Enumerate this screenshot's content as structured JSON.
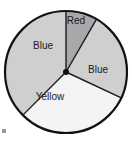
{
  "figure": {
    "background_color": "#ffffff",
    "corner_mark_color": "#9a9a9a"
  },
  "chart_data": {
    "type": "pie",
    "title": "",
    "subtitle": "",
    "xlabel": "",
    "ylabel": "",
    "legend_position": "none",
    "grid": false,
    "labels_on_slices": true,
    "center": {
      "x": 66,
      "y": 72
    },
    "radius": 61,
    "outline_color": "#111111",
    "outline_width": 2.2,
    "divider_color": "#1a1a1a",
    "divider_width": 1.4,
    "hub_color": "#111111",
    "hub_radius": 3,
    "start_angle_deg": 90,
    "direction": "clockwise",
    "categories": [
      "Red",
      "Blue",
      "Yellow",
      "Blue"
    ],
    "values": [
      8.3,
      23.6,
      30.6,
      25.0
    ],
    "slices": [
      {
        "label": "Red",
        "value": 8.3,
        "start_angle_deg": 90,
        "end_angle_deg": 60,
        "fill": "#a8a8a8",
        "label_x": 76,
        "label_y": 21
      },
      {
        "label": "Blue",
        "value": 23.6,
        "start_angle_deg": 60,
        "end_angle_deg": -25,
        "fill": "#cfcfcf",
        "label_x": 98,
        "label_y": 70
      },
      {
        "label": "Yellow",
        "value": 30.6,
        "start_angle_deg": -25,
        "end_angle_deg": -135,
        "fill": "#f4f4f4",
        "label_x": 50,
        "label_y": 97
      },
      {
        "label": "Blue",
        "value": 25.0,
        "start_angle_deg": -135,
        "end_angle_deg": -270,
        "fill": "#cfcfcf",
        "label_x": 43,
        "label_y": 46
      }
    ]
  }
}
